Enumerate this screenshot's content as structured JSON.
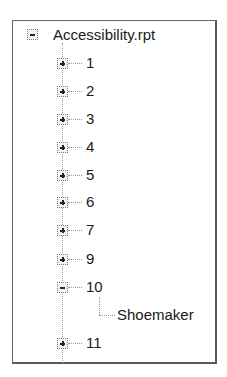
{
  "tree": {
    "root": {
      "label": "Accessibility.rpt",
      "state": "expanded"
    },
    "children": [
      {
        "label": "1",
        "state": "collapsed"
      },
      {
        "label": "2",
        "state": "collapsed"
      },
      {
        "label": "3",
        "state": "collapsed"
      },
      {
        "label": "4",
        "state": "collapsed"
      },
      {
        "label": "5",
        "state": "collapsed"
      },
      {
        "label": "6",
        "state": "collapsed"
      },
      {
        "label": "7",
        "state": "collapsed"
      },
      {
        "label": "9",
        "state": "collapsed"
      },
      {
        "label": "10",
        "state": "expanded",
        "children": [
          {
            "label": "Shoemaker"
          }
        ]
      },
      {
        "label": "11",
        "state": "collapsed"
      }
    ]
  },
  "icons": {
    "expanded": "minus-box-icon",
    "collapsed": "plus-box-icon"
  }
}
